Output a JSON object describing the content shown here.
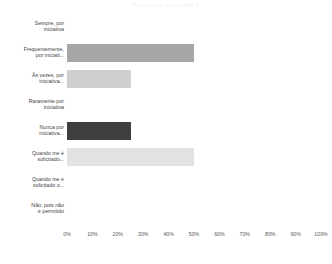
{
  "chart_data": {
    "type": "bar",
    "orientation": "horizontal",
    "title": "Proporcao e escolha 5",
    "xlabel": "",
    "ylabel": "",
    "xlim": [
      0,
      100
    ],
    "grid": false,
    "legend": null,
    "tick_labels": [
      "0%",
      "10%",
      "20%",
      "30%",
      "40%",
      "50%",
      "60%",
      "70%",
      "80%",
      "90%",
      "100%"
    ],
    "ticks": [
      0,
      10,
      20,
      30,
      40,
      50,
      60,
      70,
      80,
      90,
      100
    ],
    "categories": [
      "Sempre, por\niniciativa",
      "Frequentemente,\npor iniciati...",
      "Às vezes, por\niniciativa...",
      "Raramente por\niniciativa",
      "Nunca por\niniciativa...",
      "Quando me é\nsolicitado...",
      "Quando me é\nsolicitado o...",
      "Não, pois não\né permitido"
    ],
    "values": [
      0,
      50,
      25,
      0,
      25,
      50,
      0,
      0
    ],
    "bar_colors": [
      "#ffffff",
      "#a6a6a6",
      "#cfcfcf",
      "#ffffff",
      "#3f3f3f",
      "#e2e2e2",
      "#ffffff",
      "#ffffff"
    ]
  },
  "colors": {
    "background": "#ffffff",
    "title_text": "#f2f2f2",
    "label_text": "#3f3f3f",
    "tick_text": "#585858"
  }
}
